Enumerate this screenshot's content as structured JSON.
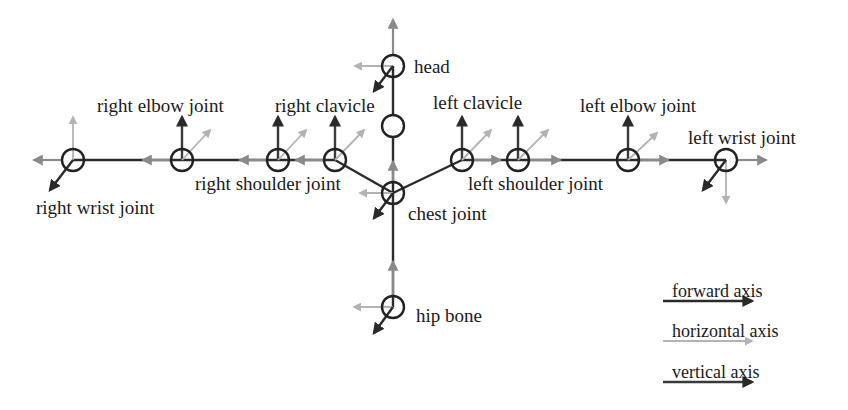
{
  "diagram": {
    "colors": {
      "background": "#ffffff",
      "bone": "#2b2b2b",
      "forward_axis": "#2a2a2a",
      "horizontal_axis": "#b3b3b3",
      "vertical_axis": "#3a3a3a",
      "chain_axis": "#8a8a8a"
    },
    "joints": [
      {
        "id": "head",
        "label": "head"
      },
      {
        "id": "neck",
        "label": ""
      },
      {
        "id": "chest",
        "label": "chest joint"
      },
      {
        "id": "hip",
        "label": "hip bone"
      },
      {
        "id": "right_clavicle",
        "label": "right clavicle"
      },
      {
        "id": "right_shoulder",
        "label": "right shoulder joint"
      },
      {
        "id": "right_elbow",
        "label": "right elbow joint"
      },
      {
        "id": "right_wrist",
        "label": "right wrist joint"
      },
      {
        "id": "left_clavicle",
        "label": "left clavicle"
      },
      {
        "id": "left_shoulder",
        "label": "left shoulder joint"
      },
      {
        "id": "left_elbow",
        "label": "left elbow joint"
      },
      {
        "id": "left_wrist",
        "label": "left wrist joint"
      }
    ],
    "labels": {
      "head": "head",
      "chest": "chest joint",
      "hip": "hip bone",
      "right_clavicle": "right clavicle",
      "right_shoulder": "right shoulder joint",
      "right_elbow": "right elbow joint",
      "right_wrist": "right wrist joint",
      "left_clavicle": "left clavicle",
      "left_shoulder": "left shoulder joint",
      "left_elbow": "left elbow joint",
      "left_wrist": "left wrist joint"
    },
    "legend": {
      "forward": "forward axis",
      "horizontal": "horizontal axis",
      "vertical": "vertical axis"
    }
  }
}
